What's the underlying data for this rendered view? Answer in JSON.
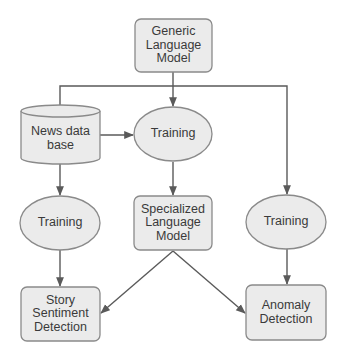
{
  "colors": {
    "node_fill": "#ebebeb",
    "node_stroke": "#8a8a8a",
    "edge": "#5a5a5a",
    "text": "#3a3a3a"
  },
  "nodes": {
    "generic_model": {
      "label": "Generic\nLanguage\nModel",
      "shape": "rounded-rect"
    },
    "news_db": {
      "label": "News data\nbase",
      "shape": "cylinder"
    },
    "training_center": {
      "label": "Training",
      "shape": "ellipse"
    },
    "training_left": {
      "label": "Training",
      "shape": "ellipse"
    },
    "specialized_model": {
      "label": "Specialized\nLanguage\nModel",
      "shape": "rounded-rect"
    },
    "training_right": {
      "label": "Training",
      "shape": "ellipse"
    },
    "story_sentiment": {
      "label": "Story\nSentiment\nDetection",
      "shape": "rounded-rect"
    },
    "anomaly_detection": {
      "label": "Anomaly\nDetection",
      "shape": "rounded-rect"
    }
  },
  "edges": [
    {
      "from": "generic_model",
      "to": "training_center"
    },
    {
      "from": "generic_model",
      "to": "news_db"
    },
    {
      "from": "generic_model",
      "to": "training_right"
    },
    {
      "from": "news_db",
      "to": "training_center"
    },
    {
      "from": "news_db",
      "to": "training_left"
    },
    {
      "from": "training_center",
      "to": "specialized_model"
    },
    {
      "from": "training_left",
      "to": "story_sentiment"
    },
    {
      "from": "specialized_model",
      "to": "story_sentiment"
    },
    {
      "from": "specialized_model",
      "to": "anomaly_detection"
    },
    {
      "from": "training_right",
      "to": "anomaly_detection"
    }
  ]
}
